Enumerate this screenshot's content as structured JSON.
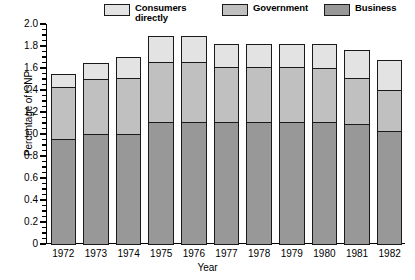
{
  "chart_data": {
    "type": "bar",
    "subtype": "stacked-vertical",
    "title": "",
    "xlabel": "Year",
    "ylabel": "Percentage of GNP",
    "categories": [
      "1972",
      "1973",
      "1974",
      "1975",
      "1976",
      "1977",
      "1978",
      "1979",
      "1980",
      "1981",
      "1982"
    ],
    "series": [
      {
        "name": "Business",
        "color": "#989898",
        "values": [
          0.96,
          1.0,
          1.0,
          1.11,
          1.11,
          1.11,
          1.11,
          1.11,
          1.11,
          1.09,
          1.03
        ]
      },
      {
        "name": "Government",
        "color": "#c0c0c0",
        "values": [
          0.47,
          0.5,
          0.51,
          0.55,
          0.55,
          0.5,
          0.5,
          0.5,
          0.49,
          0.42,
          0.37
        ]
      },
      {
        "name": "Consumers directly",
        "color": "#e3e3e3",
        "values": [
          0.12,
          0.15,
          0.19,
          0.23,
          0.23,
          0.21,
          0.21,
          0.21,
          0.22,
          0.25,
          0.27
        ]
      }
    ],
    "totals": [
      1.55,
      1.65,
      1.7,
      1.89,
      1.89,
      1.82,
      1.82,
      1.82,
      1.82,
      1.76,
      1.67
    ],
    "ylim": [
      0,
      2.0
    ],
    "ytick_values": [
      "0",
      "0.2",
      "0.4",
      "0.6",
      "0.8",
      "1.0",
      "1.2",
      "1.4",
      "1.6",
      "1.8",
      "2.0"
    ],
    "ytick_numbers": [
      0,
      0.2,
      0.4,
      0.6,
      0.8,
      1.0,
      1.2,
      1.4,
      1.6,
      1.8,
      2.0
    ],
    "minor_tick_step": 0.05,
    "grid": false,
    "legend_position": "top",
    "legend": [
      {
        "label": "Consumers\ndirectly",
        "color": "#e3e3e3"
      },
      {
        "label": "Government",
        "color": "#c0c0c0"
      },
      {
        "label": "Business",
        "color": "#989898"
      }
    ]
  },
  "colors": {
    "consumers": "#e3e3e3",
    "government": "#c0c0c0",
    "business": "#989898",
    "outline": "#1a1a1a",
    "background": "#ffffff"
  }
}
